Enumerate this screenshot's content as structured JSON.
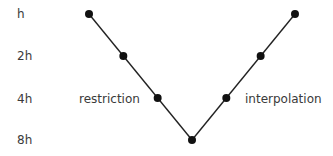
{
  "diagram": {
    "levels": [
      "h",
      "2h",
      "4h",
      "8h"
    ],
    "branch_labels": {
      "left": "restriction",
      "right": "interpolation"
    },
    "path_levels": [
      0,
      1,
      2,
      3,
      2,
      1,
      0
    ],
    "colors": {
      "line": "#222222",
      "node": "#111111",
      "text": "#3a3a3a"
    }
  }
}
